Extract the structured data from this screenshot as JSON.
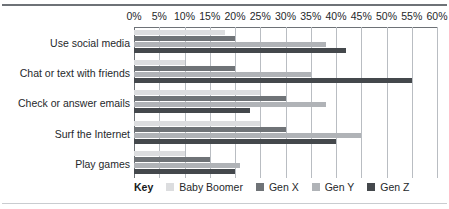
{
  "chart_data": {
    "type": "bar",
    "orientation": "horizontal",
    "title": "",
    "xlabel": "",
    "ylabel": "",
    "xlim": [
      0,
      60
    ],
    "xtick_labels": [
      "0%",
      "5%",
      "10%",
      "15%",
      "20%",
      "25%",
      "30%",
      "35%",
      "40%",
      "45%",
      "50%",
      "55%",
      "60%"
    ],
    "xticks": [
      0,
      5,
      10,
      15,
      20,
      25,
      30,
      35,
      40,
      45,
      50,
      55,
      60
    ],
    "grid": true,
    "legend_position": "bottom",
    "legend_title": "Key",
    "categories": [
      "Use social media",
      "Chat or text with friends",
      "Check or answer emails",
      "Surf the Internet",
      "Play games"
    ],
    "series": [
      {
        "name": "Baby Boomer",
        "color": "#dcdddf",
        "values": [
          18,
          10,
          25,
          25,
          10
        ]
      },
      {
        "name": "Gen X",
        "color": "#6f7377",
        "values": [
          20,
          20,
          30,
          30,
          15
        ]
      },
      {
        "name": "Gen Y",
        "color": "#b0b3b7",
        "values": [
          38,
          35,
          38,
          45,
          21
        ]
      },
      {
        "name": "Gen Z",
        "color": "#44484c",
        "values": [
          42,
          55,
          23,
          40,
          20
        ]
      }
    ]
  },
  "colors": {
    "axis": "#6e7277",
    "gridline": "#b9bdc2",
    "text": "#25282b",
    "rule_top": "#6e7277",
    "rule_bottom": "#c9ccd0"
  }
}
